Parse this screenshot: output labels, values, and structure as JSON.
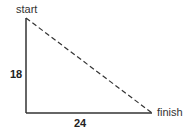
{
  "diagram": {
    "type": "right-triangle",
    "labels": {
      "start": "start",
      "finish": "finish",
      "vertical_side": "18",
      "horizontal_side": "24"
    },
    "colors": {
      "line": "#333333",
      "text": "#333333"
    }
  }
}
